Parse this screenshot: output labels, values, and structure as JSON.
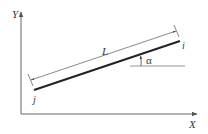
{
  "diagram": {
    "type": "member-geometry",
    "axes": {
      "x_label": "X",
      "y_label": "Y"
    },
    "member": {
      "start_node_label": "j",
      "end_node_label": "i",
      "length_label": "L",
      "angle_label": "α"
    },
    "colors": {
      "axis": "#666666",
      "member": "#222222",
      "dimension": "#555555",
      "text": "#333333"
    }
  }
}
